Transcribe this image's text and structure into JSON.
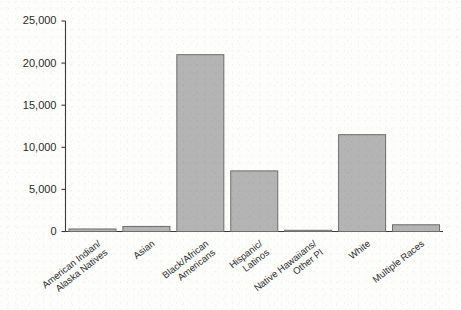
{
  "chart_data": {
    "type": "bar",
    "title": "",
    "subtitle": "",
    "xlabel": "",
    "ylabel": "",
    "ylim": [
      0,
      25000
    ],
    "grid": false,
    "legend": "none",
    "categories": [
      "American Indian/\nAlaska Natives",
      "Asian",
      "Black/African\nAmericans",
      "Hispanic/\nLatinos",
      "Native Hawaiians/\nOther PI",
      "White",
      "Multiple Races"
    ],
    "values": [
      300,
      600,
      21000,
      7200,
      60,
      11500,
      800
    ],
    "ytick_labels": [
      "0",
      "5,000",
      "10,000",
      "15,000",
      "20,000",
      "25,000"
    ],
    "ytick_values": [
      0,
      5000,
      10000,
      15000,
      20000,
      25000
    ],
    "bar_color": "#b4b4b4",
    "bar_edge_color": "#6e6e6e",
    "axis_color": "#3a3a3a",
    "background_color": "#fdfdfb",
    "category_lines": [
      [
        "American Indian/",
        "Alaska Natives"
      ],
      [
        "Asian"
      ],
      [
        "Black/African",
        "Americans"
      ],
      [
        "Hispanic/",
        "Latinos"
      ],
      [
        "Native Hawaiians/",
        "Other PI"
      ],
      [
        "White"
      ],
      [
        "Multiple Races"
      ]
    ]
  }
}
